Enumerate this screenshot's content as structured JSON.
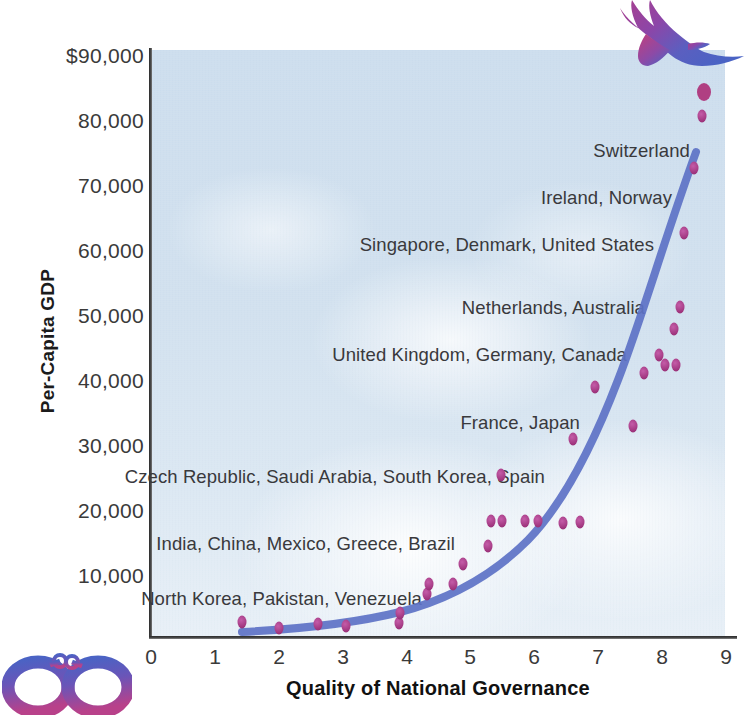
{
  "chart_data": {
    "type": "scatter",
    "title": "",
    "subtitle": "",
    "xlabel": "Quality of National Governance",
    "ylabel": "Per-Capita GDP",
    "xlim": [
      0,
      9
    ],
    "ylim": [
      0,
      90000
    ],
    "grid": false,
    "legend": "none",
    "xticks": [
      "0",
      "1",
      "2",
      "3",
      "4",
      "5",
      "6",
      "7",
      "8",
      "9"
    ],
    "xtick_values": [
      0,
      1,
      2,
      3,
      4,
      5,
      6,
      7,
      8,
      9
    ],
    "yticks": [
      "$90,000",
      "80,000",
      "70,000",
      "60,000",
      "50,000",
      "40,000",
      "30,000",
      "20,000",
      "10,000"
    ],
    "ytick_values": [
      90000,
      80000,
      70000,
      60000,
      50000,
      40000,
      30000,
      20000,
      10000
    ],
    "series": [
      {
        "name": "Countries",
        "marker": "ellipse",
        "color": "#a8458a",
        "points": [
          {
            "x": 1.42,
            "y": 2200
          },
          {
            "x": 2.0,
            "y": 1300
          },
          {
            "x": 2.62,
            "y": 1900
          },
          {
            "x": 3.05,
            "y": 1600
          },
          {
            "x": 3.88,
            "y": 2000
          },
          {
            "x": 3.9,
            "y": 3600
          },
          {
            "x": 4.32,
            "y": 6500
          },
          {
            "x": 4.35,
            "y": 8000
          },
          {
            "x": 4.72,
            "y": 8000
          },
          {
            "x": 4.88,
            "y": 11200
          },
          {
            "x": 5.28,
            "y": 14000
          },
          {
            "x": 5.32,
            "y": 17800
          },
          {
            "x": 5.5,
            "y": 17800
          },
          {
            "x": 5.48,
            "y": 25000
          },
          {
            "x": 5.85,
            "y": 17800
          },
          {
            "x": 6.05,
            "y": 17800
          },
          {
            "x": 6.45,
            "y": 17500
          },
          {
            "x": 6.72,
            "y": 17600
          },
          {
            "x": 6.6,
            "y": 30500
          },
          {
            "x": 6.95,
            "y": 38500
          },
          {
            "x": 7.55,
            "y": 32500
          },
          {
            "x": 7.72,
            "y": 40800
          },
          {
            "x": 7.95,
            "y": 43500
          },
          {
            "x": 8.05,
            "y": 42000
          },
          {
            "x": 8.18,
            "y": 47500
          },
          {
            "x": 8.22,
            "y": 42000
          },
          {
            "x": 8.28,
            "y": 51000
          },
          {
            "x": 8.35,
            "y": 62500
          },
          {
            "x": 8.5,
            "y": 72500
          },
          {
            "x": 8.62,
            "y": 80500
          }
        ]
      }
    ],
    "trendline": {
      "name": "Exponential fit",
      "color": "#5d72c6",
      "description": "Smooth exponential curve rising from near-zero GDP at governance 1.4 to about 73,000 at governance 8.6"
    },
    "annotations": [
      {
        "text": "Switzerland",
        "x": 8.55,
        "y": 74500
      },
      {
        "text": "Ireland, Norway",
        "x": 8.3,
        "y": 66500
      },
      {
        "text": "Singapore, Denmark, United States",
        "x": 8.05,
        "y": 59500
      },
      {
        "text": "Netherlands, Australia",
        "x": 7.9,
        "y": 51000
      },
      {
        "text": "United Kingdom, Germany, Canada",
        "x": 7.6,
        "y": 44000
      },
      {
        "text": "France, Japan",
        "x": 6.6,
        "y": 33500
      },
      {
        "text": "Czech Republic, Saudi Arabia, South Korea, Spain",
        "x": 6.4,
        "y": 24000
      },
      {
        "text": "India, China, Mexico, Greece, Brazil",
        "x": 5.5,
        "y": 14500
      },
      {
        "text": "North Korea, Pakistan, Venezuela",
        "x": 4.8,
        "y": 6800
      }
    ]
  },
  "figure": {
    "y_axis_title": "Per-Capita GDP",
    "x_axis_title": "Quality of National Governance",
    "y_tick_labels": [
      "$90,000",
      "80,000",
      "70,000",
      "60,000",
      "50,000",
      "40,000",
      "30,000",
      "20,000",
      "10,000"
    ],
    "x_tick_labels": [
      "0",
      "1",
      "2",
      "3",
      "4",
      "5",
      "6",
      "7",
      "8",
      "9"
    ],
    "country_labels": [
      "Switzerland",
      "Ireland, Norway",
      "Singapore, Denmark, United States",
      "Netherlands, Australia",
      "United Kingdom, Germany, Canada",
      "France, Japan",
      "Czech Republic, Saudi Arabia, South Korea, Spain",
      "India, China, Mexico, Greece, Brazil",
      "North Korea, Pakistan, Venezuela"
    ],
    "decorations": [
      {
        "name": "eagle-illustration",
        "description": "flying eagle"
      },
      {
        "name": "handcuffs-illustration",
        "description": "pair of handcuffs"
      }
    ],
    "colors": {
      "trendline": "#5d72c6",
      "data_point": "#a8458a",
      "plot_background": "#d3e1ef",
      "axis": "#2a2a2a",
      "text": "#39393c"
    }
  }
}
